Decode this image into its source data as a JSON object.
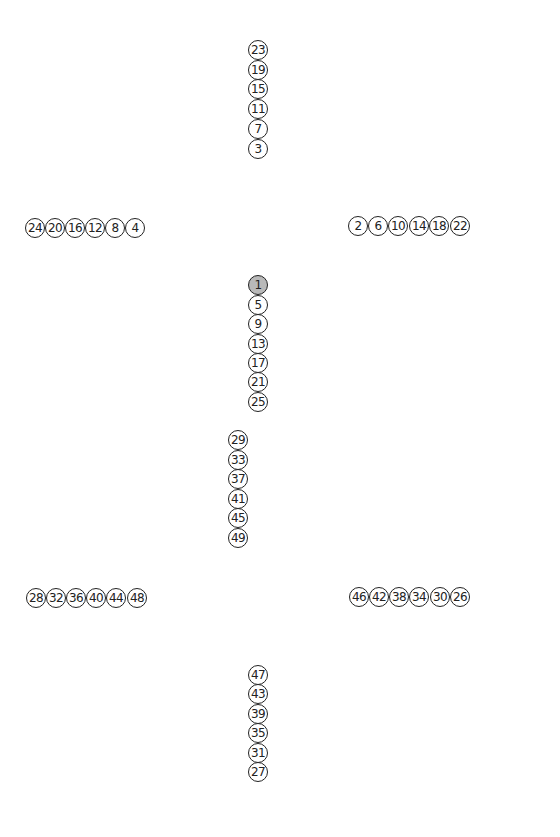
{
  "diagram": {
    "node_style": {
      "border_color": "#222222",
      "fill_color": "#ffffff",
      "active_fill_color": "#b9b9b9",
      "text_color": "#222222",
      "diameter": 20
    },
    "groups": [
      {
        "id": "top-column",
        "orientation": "vertical",
        "nodes": [
          {
            "label": "23",
            "x": 258,
            "y": 50
          },
          {
            "label": "19",
            "x": 258,
            "y": 70
          },
          {
            "label": "15",
            "x": 258,
            "y": 89
          },
          {
            "label": "11",
            "x": 258,
            "y": 109
          },
          {
            "label": "7",
            "x": 258,
            "y": 129
          },
          {
            "label": "3",
            "x": 258,
            "y": 149
          }
        ]
      },
      {
        "id": "left-row",
        "orientation": "horizontal",
        "nodes": [
          {
            "label": "24",
            "x": 35,
            "y": 228
          },
          {
            "label": "20",
            "x": 55,
            "y": 228
          },
          {
            "label": "16",
            "x": 75,
            "y": 228
          },
          {
            "label": "12",
            "x": 95,
            "y": 228
          },
          {
            "label": "8",
            "x": 115,
            "y": 228
          },
          {
            "label": "4",
            "x": 135,
            "y": 228
          }
        ]
      },
      {
        "id": "right-row",
        "orientation": "horizontal",
        "nodes": [
          {
            "label": "2",
            "x": 358,
            "y": 226
          },
          {
            "label": "6",
            "x": 378,
            "y": 226
          },
          {
            "label": "10",
            "x": 398,
            "y": 226
          },
          {
            "label": "14",
            "x": 419,
            "y": 226
          },
          {
            "label": "18",
            "x": 439,
            "y": 226
          },
          {
            "label": "22",
            "x": 460,
            "y": 226
          }
        ]
      },
      {
        "id": "center-column",
        "orientation": "vertical",
        "nodes": [
          {
            "label": "1",
            "x": 258,
            "y": 285,
            "active": true
          },
          {
            "label": "5",
            "x": 258,
            "y": 305
          },
          {
            "label": "9",
            "x": 258,
            "y": 324
          },
          {
            "label": "13",
            "x": 258,
            "y": 344
          },
          {
            "label": "17",
            "x": 258,
            "y": 363
          },
          {
            "label": "21",
            "x": 258,
            "y": 382
          },
          {
            "label": "25",
            "x": 258,
            "y": 402
          }
        ]
      },
      {
        "id": "lower-column",
        "orientation": "vertical",
        "nodes": [
          {
            "label": "29",
            "x": 238,
            "y": 440
          },
          {
            "label": "33",
            "x": 238,
            "y": 460
          },
          {
            "label": "37",
            "x": 238,
            "y": 479
          },
          {
            "label": "41",
            "x": 238,
            "y": 499
          },
          {
            "label": "45",
            "x": 238,
            "y": 518
          },
          {
            "label": "49",
            "x": 238,
            "y": 538
          }
        ]
      },
      {
        "id": "bottom-left-row",
        "orientation": "horizontal",
        "nodes": [
          {
            "label": "28",
            "x": 36,
            "y": 598
          },
          {
            "label": "32",
            "x": 56,
            "y": 598
          },
          {
            "label": "36",
            "x": 76,
            "y": 598
          },
          {
            "label": "40",
            "x": 96,
            "y": 598
          },
          {
            "label": "44",
            "x": 116,
            "y": 598
          },
          {
            "label": "48",
            "x": 137,
            "y": 598
          }
        ]
      },
      {
        "id": "bottom-right-row",
        "orientation": "horizontal",
        "nodes": [
          {
            "label": "46",
            "x": 359,
            "y": 597
          },
          {
            "label": "42",
            "x": 379,
            "y": 597
          },
          {
            "label": "38",
            "x": 399,
            "y": 597
          },
          {
            "label": "34",
            "x": 419,
            "y": 597
          },
          {
            "label": "30",
            "x": 440,
            "y": 597
          },
          {
            "label": "26",
            "x": 460,
            "y": 597
          }
        ]
      },
      {
        "id": "bottom-column",
        "orientation": "vertical",
        "nodes": [
          {
            "label": "47",
            "x": 258,
            "y": 675
          },
          {
            "label": "43",
            "x": 258,
            "y": 694
          },
          {
            "label": "39",
            "x": 258,
            "y": 714
          },
          {
            "label": "35",
            "x": 258,
            "y": 733
          },
          {
            "label": "31",
            "x": 258,
            "y": 753
          },
          {
            "label": "27",
            "x": 258,
            "y": 772
          }
        ]
      }
    ]
  }
}
